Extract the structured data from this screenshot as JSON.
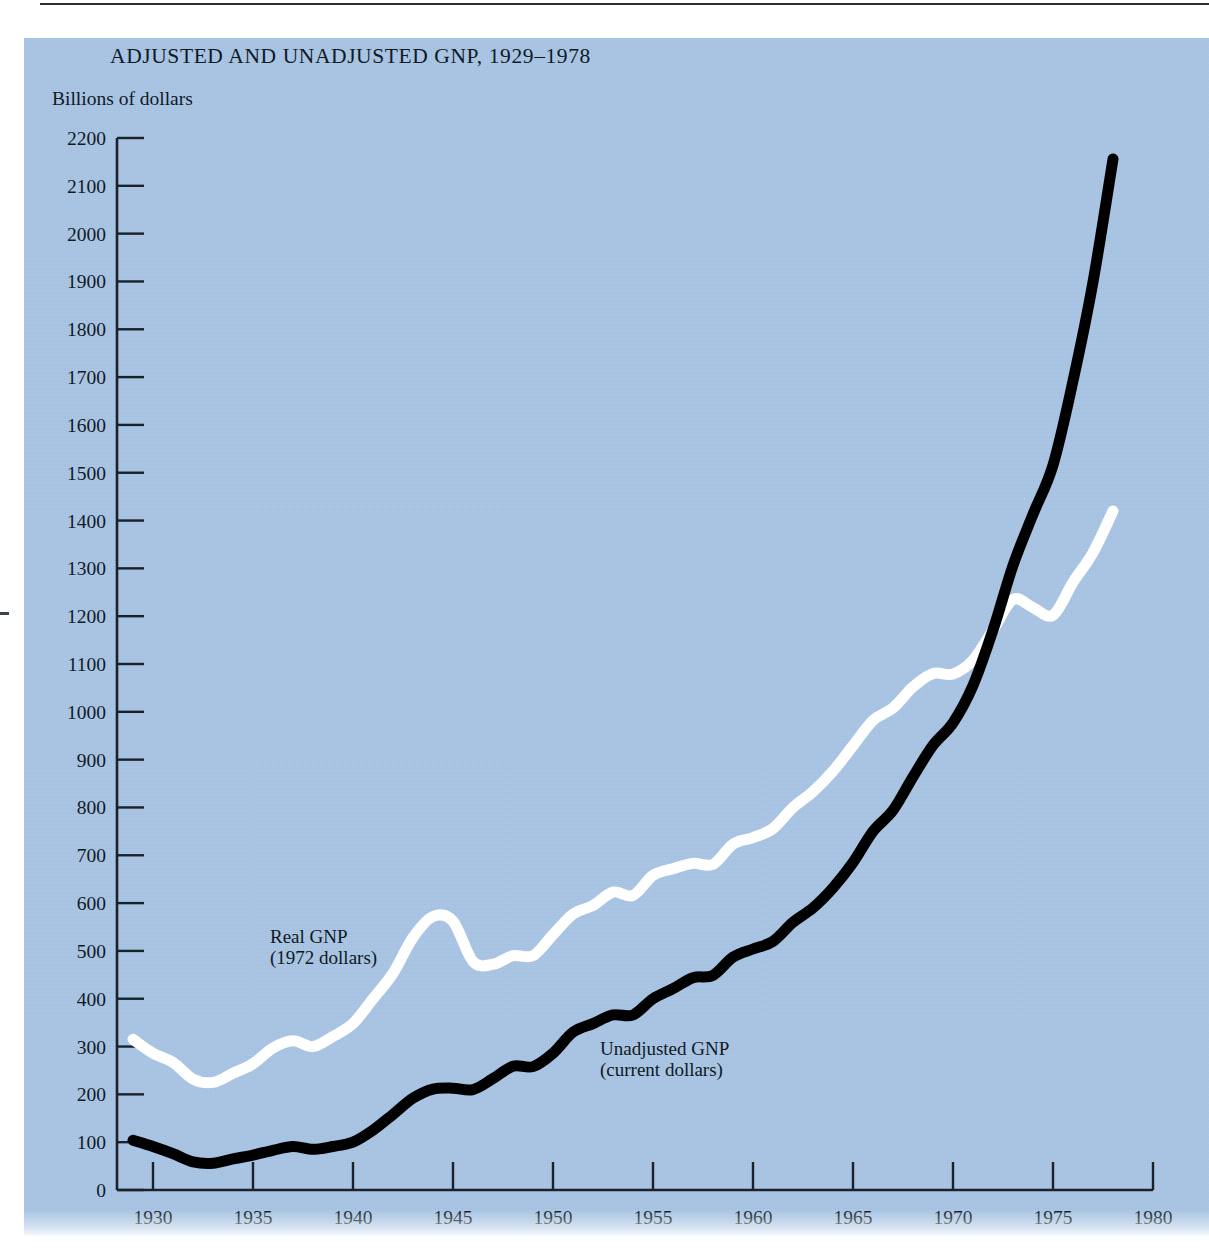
{
  "figure": {
    "title": "ADJUSTED AND UNADJUSTED GNP, 1929–1978",
    "y_axis_caption": "Billions of dollars",
    "background_color": "#a7c4e4",
    "plate_border_color": "#ffffff"
  },
  "annotations": {
    "real": {
      "line1": "Real GNP",
      "line2": "(1972 dollars)",
      "color": "#ffffff"
    },
    "unadjusted": {
      "line1": "Unadjusted GNP",
      "line2": "(current dollars)",
      "color": "#000000"
    }
  },
  "chart_data": {
    "type": "line",
    "title": "ADJUSTED AND UNADJUSTED GNP, 1929–1978",
    "xlabel": "",
    "ylabel": "Billions of dollars",
    "xlim": [
      1928.2,
      1980.0
    ],
    "ylim": [
      0,
      2200
    ],
    "grid": false,
    "legend": "inline-annotations",
    "x_ticks": [
      1930,
      1935,
      1940,
      1945,
      1950,
      1955,
      1960,
      1965,
      1970,
      1975,
      1980
    ],
    "x_tick_labels": [
      "1930",
      "1935",
      "1940",
      "1945",
      "1950",
      "1955",
      "1960",
      "1965",
      "1970",
      "1975",
      "1980"
    ],
    "y_ticks": [
      0,
      100,
      200,
      300,
      400,
      500,
      600,
      700,
      800,
      900,
      1000,
      1100,
      1200,
      1300,
      1400,
      1500,
      1600,
      1700,
      1800,
      1900,
      2000,
      2100,
      2200
    ],
    "y_tick_labels": [
      "0",
      "100",
      "200",
      "300",
      "400",
      "500",
      "600",
      "700",
      "800",
      "900",
      "1000",
      "1100",
      "1200",
      "1300",
      "1400",
      "1500",
      "1600",
      "1700",
      "1800",
      "1900",
      "2000",
      "2100",
      "2200"
    ],
    "x": [
      1929,
      1930,
      1931,
      1932,
      1933,
      1934,
      1935,
      1936,
      1937,
      1938,
      1939,
      1940,
      1941,
      1942,
      1943,
      1944,
      1945,
      1946,
      1947,
      1948,
      1949,
      1950,
      1951,
      1952,
      1953,
      1954,
      1955,
      1956,
      1957,
      1958,
      1959,
      1960,
      1961,
      1962,
      1963,
      1964,
      1965,
      1966,
      1967,
      1968,
      1969,
      1970,
      1971,
      1972,
      1973,
      1974,
      1975,
      1976,
      1977,
      1978
    ],
    "series": [
      {
        "name": "Real GNP (1972 dollars)",
        "color": "#ffffff",
        "values": [
          315,
          286,
          267,
          232,
          225,
          244,
          264,
          297,
          312,
          300,
          321,
          348,
          400,
          453,
          528,
          572,
          562,
          478,
          472,
          490,
          490,
          534,
          577,
          595,
          623,
          616,
          658,
          672,
          683,
          681,
          723,
          737,
          756,
          800,
          833,
          876,
          929,
          982,
          1008,
          1052,
          1080,
          1079,
          1108,
          1171,
          1235,
          1218,
          1202,
          1271,
          1333,
          1420
        ]
      },
      {
        "name": "Unadjusted GNP (current dollars)",
        "color": "#000000",
        "values": [
          104,
          91,
          76,
          59,
          56,
          65,
          73,
          83,
          91,
          85,
          91,
          100,
          125,
          158,
          192,
          211,
          213,
          210,
          233,
          259,
          258,
          286,
          330,
          348,
          366,
          366,
          400,
          421,
          444,
          449,
          487,
          504,
          520,
          560,
          590,
          632,
          685,
          750,
          794,
          864,
          930,
          977,
          1055,
          1171,
          1306,
          1413,
          1516,
          1692,
          1899,
          2156
        ]
      }
    ]
  }
}
